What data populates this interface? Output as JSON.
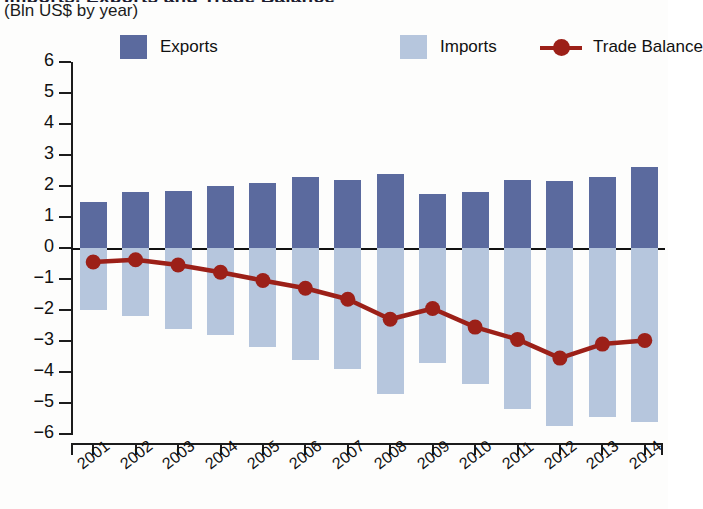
{
  "title": "Imports, Exports and Trade Balance",
  "subtitle": "(Bln US$ by year)",
  "legend": {
    "items": [
      {
        "label": "Exports",
        "type": "swatch",
        "color": "#5b6a9e",
        "icon": "square-swatch-icon"
      },
      {
        "label": "Imports",
        "type": "swatch",
        "color": "#b6c6dd",
        "icon": "square-swatch-icon"
      },
      {
        "label": "Trade Balance",
        "type": "line",
        "color": "#9c2018",
        "icon": "line-marker-icon"
      }
    ]
  },
  "colors": {
    "exports": "#5b6a9e",
    "imports": "#b6c6dd",
    "trade_balance": "#9c2018",
    "axis": "#1c1c1c"
  },
  "axis": {
    "y_ticks": [
      "6",
      "5",
      "4",
      "3",
      "2",
      "1",
      "0",
      "-1",
      "-2",
      "-3",
      "-4",
      "-5",
      "-6"
    ],
    "y_min": -6,
    "y_max": 6
  },
  "chart_data": {
    "type": "bar",
    "title": "Imports, Exports and Trade Balance",
    "subtitle": "(Bln US$ by year)",
    "xlabel": "",
    "ylabel": "Bln US$",
    "ylim": [
      -6,
      6
    ],
    "ytick_step": 1,
    "grid": false,
    "legend_position": "top",
    "categories": [
      "2001",
      "2002",
      "2003",
      "2004",
      "2005",
      "2006",
      "2007",
      "2008",
      "2009",
      "2010",
      "2011",
      "2012",
      "2013",
      "2014"
    ],
    "series": [
      {
        "name": "Exports",
        "type": "bar",
        "color": "#5b6a9e",
        "values": [
          1.5,
          1.8,
          1.85,
          2.0,
          2.1,
          2.3,
          2.2,
          2.4,
          1.75,
          1.8,
          2.2,
          2.15,
          2.3,
          2.6
        ]
      },
      {
        "name": "Imports",
        "type": "bar",
        "color": "#b6c6dd",
        "values": [
          -2.0,
          -2.2,
          -2.6,
          -2.8,
          -3.2,
          -3.6,
          -3.9,
          -4.7,
          -3.7,
          -4.4,
          -5.2,
          -5.75,
          -5.45,
          -5.6
        ]
      },
      {
        "name": "Trade Balance",
        "type": "line",
        "color": "#9c2018",
        "values": [
          -0.45,
          -0.38,
          -0.55,
          -0.78,
          -1.05,
          -1.3,
          -1.65,
          -2.3,
          -1.95,
          -2.55,
          -2.95,
          -3.55,
          -3.1,
          -2.98
        ]
      }
    ]
  }
}
